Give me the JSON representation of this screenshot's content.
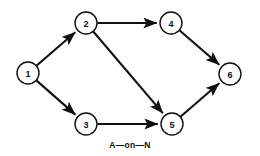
{
  "diagram": {
    "title": "A—on—N",
    "caption": "A—on—N",
    "type": "activity-on-node network",
    "colors": {
      "background": "#fefefe",
      "stroke": "#101010",
      "node_fill": "#ffffff"
    },
    "geometry": {
      "width": 260,
      "height": 156,
      "node_radius": 11
    },
    "nodes": [
      {
        "id": "1",
        "label": "1",
        "cx": 28,
        "cy": 73
      },
      {
        "id": "2",
        "label": "2",
        "cx": 86,
        "cy": 23
      },
      {
        "id": "3",
        "label": "3",
        "cx": 86,
        "cy": 124
      },
      {
        "id": "4",
        "label": "4",
        "cx": 171,
        "cy": 23
      },
      {
        "id": "5",
        "label": "5",
        "cx": 172,
        "cy": 124
      },
      {
        "id": "6",
        "label": "6",
        "cx": 230,
        "cy": 74
      }
    ],
    "edges": [
      {
        "id": "edge-1-2",
        "from": "1",
        "to": "2",
        "arrow": "end"
      },
      {
        "id": "edge-1-3",
        "from": "1",
        "to": "3",
        "arrow": "end"
      },
      {
        "id": "edge-2-4",
        "from": "2",
        "to": "4",
        "arrow": "end"
      },
      {
        "id": "edge-2-5",
        "from": "2",
        "to": "5",
        "arrow": "end"
      },
      {
        "id": "edge-3-5",
        "from": "3",
        "to": "5",
        "arrow": "end"
      },
      {
        "id": "edge-4-6",
        "from": "4",
        "to": "6",
        "arrow": "end"
      },
      {
        "id": "edge-5-6",
        "from": "5",
        "to": "6",
        "arrow": "end"
      }
    ],
    "caption_position": {
      "x": 130,
      "y": 145
    }
  }
}
